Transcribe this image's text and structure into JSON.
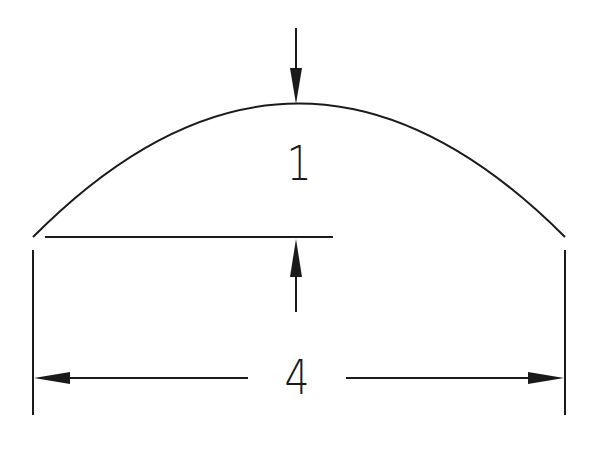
{
  "diagram": {
    "type": "dimensioned-circular-segment",
    "colors": {
      "line": "#1a1a1a",
      "background": "#ffffff"
    },
    "arc": {
      "start": [
        33,
        237
      ],
      "apex": [
        296,
        104
      ],
      "end": [
        565,
        237
      ]
    },
    "chord_line": {
      "from": [
        45,
        237
      ],
      "to": [
        333,
        237
      ]
    },
    "labels": {
      "height": "1",
      "width": "4"
    },
    "dimensions": [
      {
        "name": "height",
        "value": "1",
        "orientation": "vertical"
      },
      {
        "name": "width",
        "value": "4",
        "orientation": "horizontal"
      }
    ]
  }
}
